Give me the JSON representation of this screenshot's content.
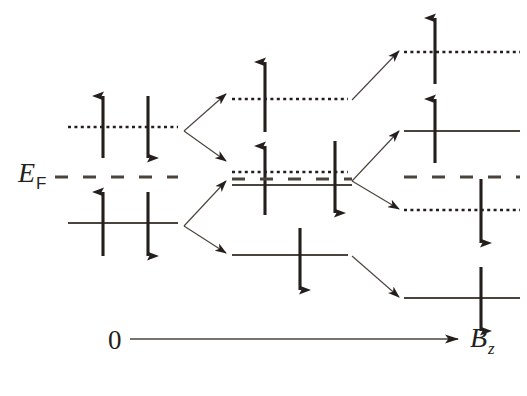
{
  "figure": {
    "background_color": "#ffffff",
    "ink_color": "#241f1c",
    "line_color": "#4a443c"
  },
  "labels": {
    "fermi_energy": "E",
    "fermi_energy_sub": "F",
    "axis_origin": "0",
    "axis_field": "B",
    "axis_field_sub": "z"
  },
  "legend_semantics": {
    "solid_line": "occupied level",
    "dotted_line": "unoccupied level",
    "dashed_line": "Fermi level E_F",
    "up_arrow": "spin up",
    "down_arrow": "spin down"
  },
  "columns": [
    {
      "name": "zero-field",
      "field_value": "0",
      "x_start": 68,
      "x_end": 178,
      "levels": [
        {
          "id": "l0-upper",
          "y": 127,
          "style": "dotted",
          "arrows": [
            {
              "spin": "up",
              "x": 103
            },
            {
              "spin": "down",
              "x": 148
            }
          ]
        },
        {
          "id": "l0-lower",
          "y": 223,
          "style": "solid",
          "arrows": [
            {
              "spin": "up",
              "x": 103
            },
            {
              "spin": "down",
              "x": 148
            }
          ]
        }
      ]
    },
    {
      "name": "intermediate-field",
      "x_start": 232,
      "x_end": 348,
      "levels": [
        {
          "id": "m-1",
          "y": 99,
          "style": "dotted",
          "arrows": [
            {
              "spin": "up",
              "x": 265
            }
          ]
        },
        {
          "id": "m-2",
          "y": 172,
          "style": "dotted",
          "arrows": [
            {
              "spin": "up",
              "x": 265
            },
            {
              "spin": "down",
              "x": 335
            }
          ]
        },
        {
          "id": "m-3",
          "y": 184,
          "style": "solid",
          "arrows": []
        },
        {
          "id": "m-4",
          "y": 255,
          "style": "solid",
          "arrows": [
            {
              "spin": "down",
              "x": 300
            }
          ]
        }
      ]
    },
    {
      "name": "high-field",
      "x_start": 404,
      "x_end": 520,
      "levels": [
        {
          "id": "r-1",
          "y": 52,
          "style": "dotted",
          "arrows": [
            {
              "spin": "up",
              "x": 435
            }
          ]
        },
        {
          "id": "r-2",
          "y": 131,
          "style": "solid",
          "arrows": [
            {
              "spin": "up",
              "x": 435
            }
          ]
        },
        {
          "id": "r-3",
          "y": 210,
          "style": "dotted",
          "arrows": [
            {
              "spin": "down",
              "x": 481
            }
          ]
        },
        {
          "id": "r-4",
          "y": 298,
          "style": "solid",
          "arrows": [
            {
              "spin": "down",
              "x": 481
            }
          ]
        }
      ]
    }
  ],
  "fermi_line": {
    "y": 177,
    "x_start": 55,
    "x_end": 520,
    "style": "dashed"
  },
  "split_arrows": [
    {
      "from": [
        182,
        127
      ],
      "to": [
        228,
        93
      ],
      "branch": "up"
    },
    {
      "from": [
        182,
        127
      ],
      "to": [
        228,
        160
      ],
      "branch": "down"
    },
    {
      "from": [
        182,
        223
      ],
      "to": [
        228,
        180
      ],
      "branch": "up"
    },
    {
      "from": [
        182,
        223
      ],
      "to": [
        228,
        252
      ],
      "branch": "down"
    },
    {
      "from": [
        352,
        99
      ],
      "to": [
        400,
        50
      ],
      "branch": "up"
    },
    {
      "from": [
        352,
        178
      ],
      "to": [
        400,
        130
      ],
      "branch": "up"
    },
    {
      "from": [
        352,
        178
      ],
      "to": [
        400,
        208
      ],
      "branch": "down"
    },
    {
      "from": [
        352,
        255
      ],
      "to": [
        400,
        296
      ],
      "branch": "down"
    }
  ],
  "axis": {
    "y": 339,
    "x_start": 130,
    "x_end": 460
  }
}
